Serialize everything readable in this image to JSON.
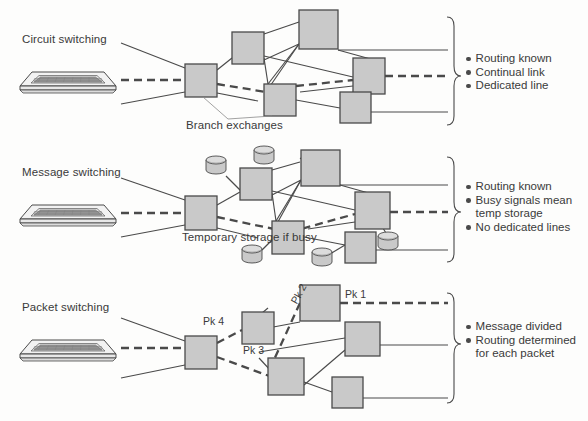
{
  "diagram": {
    "colors": {
      "node_fill": "#c9c9c9",
      "node_stroke": "#4a4a4a",
      "line": "#4a4a4a",
      "dashed_line": "#4a4a4a",
      "text": "#3a3a3a",
      "background": "#fdfdfc",
      "terminal_fill": "#efefef"
    },
    "sections": [
      {
        "id": "circuit-switching",
        "label": "Circuit switching",
        "annotation": "Branch exchanges",
        "bullets": [
          "Routing known",
          "Continual link",
          "Dedicated line"
        ],
        "packet_labels": []
      },
      {
        "id": "message-switching",
        "label": "Message switching",
        "annotation": "Temporary\nstorage\nif busy",
        "bullets": [
          "Routing known",
          "Busy signals mean\ntemp storage",
          "No dedicated lines"
        ],
        "packet_labels": []
      },
      {
        "id": "packet-switching",
        "label": "Packet switching",
        "annotation": "",
        "bullets": [
          "Message divided",
          "Routing determined\nfor each packet"
        ],
        "packet_labels": [
          "Pk 1",
          "Pk 2",
          "Pk 3",
          "Pk 4"
        ]
      }
    ],
    "icons": {
      "terminal": "computer-terminal-keyboard-icon",
      "node": "switching-node-box-icon",
      "storage": "storage-cylinder-icon",
      "bracket": "curly-brace-icon",
      "bullet": "bullet-dot-icon"
    }
  }
}
